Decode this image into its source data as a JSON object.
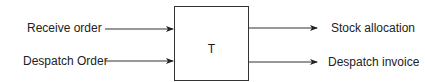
{
  "diagram": {
    "process": {
      "label": "T"
    },
    "inputs": [
      {
        "label": "Receive order"
      },
      {
        "label": "Despatch Order"
      }
    ],
    "outputs": [
      {
        "label": "Stock allocation"
      },
      {
        "label": "Despatch invoice"
      }
    ],
    "colors": {
      "stroke": "#333333",
      "text": "#222222",
      "background": "#ffffff"
    }
  }
}
